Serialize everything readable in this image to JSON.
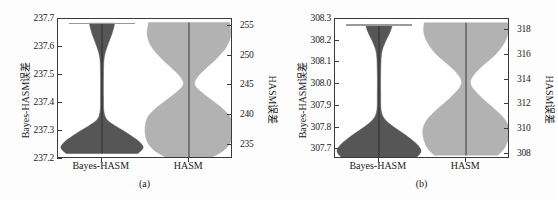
{
  "figure": {
    "type": "violin-plot-figure",
    "panel_count": 2,
    "colors": {
      "violin_dark": "#565656",
      "violin_light": "#b2b2b2",
      "axis": "#3a3a3a",
      "background": "#ffffff"
    }
  },
  "panels": [
    {
      "id": "a",
      "caption": "(a)",
      "left_axis_title": "Bayes-HASM误差",
      "right_axis_title": "HASM误差",
      "left_ticks": [
        "237.7",
        "237.6",
        "237.5",
        "237.4",
        "237.3",
        "237.2"
      ],
      "right_ticks": [
        "255",
        "250",
        "245",
        "240",
        "235"
      ],
      "x_categories": [
        "Bayes-HASM",
        "HASM"
      ]
    },
    {
      "id": "b",
      "caption": "(b)",
      "left_axis_title": "Bayes-HASM误差",
      "right_axis_title": "HASM误差",
      "left_ticks": [
        "308.3",
        "308.2",
        "308.1",
        "308.0",
        "307.9",
        "307.8",
        "307.7"
      ],
      "right_ticks": [
        "318",
        "316",
        "314",
        "312",
        "310",
        "308"
      ],
      "x_categories": [
        "Bayes-HASM",
        "HASM"
      ]
    }
  ],
  "chart_data": [
    {
      "type": "violin",
      "panel": "(a)",
      "title": "",
      "xlabel": "",
      "ylabel": "Bayes-HASM误差",
      "ylabel_right": "HASM误差",
      "categories": [
        "Bayes-HASM",
        "HASM"
      ],
      "grid": false,
      "legend": "none",
      "left_axis": {
        "label": "Bayes-HASM误差",
        "ticks": [
          237.2,
          237.3,
          237.4,
          237.5,
          237.6,
          237.7
        ],
        "ylim": [
          237.2,
          237.7
        ]
      },
      "right_axis": {
        "label": "HASM误差",
        "ticks": [
          235,
          240,
          245,
          250,
          255
        ],
        "ylim": [
          232.6,
          256.2
        ]
      },
      "series": [
        {
          "name": "Bayes-HASM",
          "axis": "left",
          "color": "#565656",
          "min": 237.22,
          "max": 237.685,
          "median": 237.33,
          "whisker_top": 237.685,
          "density_profile": [
            {
              "y": 237.22,
              "w": 0.86
            },
            {
              "y": 237.24,
              "w": 0.98
            },
            {
              "y": 237.26,
              "w": 0.9
            },
            {
              "y": 237.28,
              "w": 0.72
            },
            {
              "y": 237.3,
              "w": 0.52
            },
            {
              "y": 237.32,
              "w": 0.3
            },
            {
              "y": 237.34,
              "w": 0.12
            },
            {
              "y": 237.37,
              "w": 0.045
            },
            {
              "y": 237.42,
              "w": 0.035
            },
            {
              "y": 237.5,
              "w": 0.035
            },
            {
              "y": 237.56,
              "w": 0.05
            },
            {
              "y": 237.6,
              "w": 0.12
            },
            {
              "y": 237.64,
              "w": 0.22
            },
            {
              "y": 237.67,
              "w": 0.28
            },
            {
              "y": 237.685,
              "w": 0.3
            }
          ]
        },
        {
          "name": "HASM",
          "axis": "right",
          "color": "#b2b2b2",
          "min": 232.9,
          "max": 255.6,
          "median": 244.5,
          "density_profile": [
            {
              "y": 232.9,
              "w": 0.52
            },
            {
              "y": 234.0,
              "w": 0.78
            },
            {
              "y": 235.5,
              "w": 0.95
            },
            {
              "y": 237.5,
              "w": 1.0
            },
            {
              "y": 239.5,
              "w": 0.95
            },
            {
              "y": 241.0,
              "w": 0.78
            },
            {
              "y": 242.5,
              "w": 0.52
            },
            {
              "y": 244.0,
              "w": 0.26
            },
            {
              "y": 245.2,
              "w": 0.13
            },
            {
              "y": 246.5,
              "w": 0.2
            },
            {
              "y": 248.0,
              "w": 0.4
            },
            {
              "y": 249.5,
              "w": 0.62
            },
            {
              "y": 251.5,
              "w": 0.85
            },
            {
              "y": 253.5,
              "w": 0.95
            },
            {
              "y": 255.6,
              "w": 0.92
            }
          ]
        }
      ]
    },
    {
      "type": "violin",
      "panel": "(b)",
      "title": "",
      "xlabel": "",
      "ylabel": "Bayes-HASM误差",
      "ylabel_right": "HASM误差",
      "categories": [
        "Bayes-HASM",
        "HASM"
      ],
      "grid": false,
      "legend": "none",
      "left_axis": {
        "label": "Bayes-HASM误差",
        "ticks": [
          307.7,
          307.8,
          307.9,
          308.0,
          308.1,
          308.2,
          308.3
        ],
        "ylim": [
          307.655,
          308.3
        ]
      },
      "right_axis": {
        "label": "HASM误差",
        "ticks": [
          308,
          310,
          312,
          314,
          316,
          318
        ],
        "ylim": [
          307.6,
          318.9
        ]
      },
      "series": [
        {
          "name": "Bayes-HASM",
          "axis": "left",
          "color": "#565656",
          "min": 307.66,
          "max": 308.275,
          "median": 307.8,
          "whisker_top": 308.275,
          "density_profile": [
            {
              "y": 307.66,
              "w": 0.88
            },
            {
              "y": 307.69,
              "w": 1.0
            },
            {
              "y": 307.72,
              "w": 0.92
            },
            {
              "y": 307.75,
              "w": 0.74
            },
            {
              "y": 307.78,
              "w": 0.52
            },
            {
              "y": 307.81,
              "w": 0.3
            },
            {
              "y": 307.84,
              "w": 0.13
            },
            {
              "y": 307.88,
              "w": 0.05
            },
            {
              "y": 307.95,
              "w": 0.04
            },
            {
              "y": 308.05,
              "w": 0.04
            },
            {
              "y": 308.14,
              "w": 0.06
            },
            {
              "y": 308.19,
              "w": 0.14
            },
            {
              "y": 308.23,
              "w": 0.24
            },
            {
              "y": 308.26,
              "w": 0.3
            },
            {
              "y": 308.275,
              "w": 0.31
            }
          ]
        },
        {
          "name": "HASM",
          "axis": "right",
          "color": "#b2b2b2",
          "min": 307.9,
          "max": 318.6,
          "median": 313.4,
          "density_profile": [
            {
              "y": 307.9,
              "w": 0.72
            },
            {
              "y": 308.4,
              "w": 0.86
            },
            {
              "y": 309.2,
              "w": 0.96
            },
            {
              "y": 310.0,
              "w": 0.98
            },
            {
              "y": 310.8,
              "w": 0.88
            },
            {
              "y": 311.6,
              "w": 0.66
            },
            {
              "y": 312.4,
              "w": 0.4
            },
            {
              "y": 313.2,
              "w": 0.18
            },
            {
              "y": 313.8,
              "w": 0.1
            },
            {
              "y": 314.4,
              "w": 0.18
            },
            {
              "y": 315.2,
              "w": 0.4
            },
            {
              "y": 316.0,
              "w": 0.66
            },
            {
              "y": 316.9,
              "w": 0.86
            },
            {
              "y": 317.8,
              "w": 0.96
            },
            {
              "y": 318.6,
              "w": 0.95
            }
          ]
        }
      ]
    }
  ]
}
